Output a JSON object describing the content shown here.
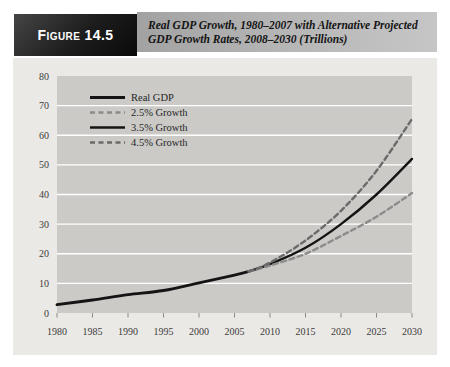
{
  "header": {
    "figure_label": "Figure 14.5",
    "title_line1": "Real GDP Growth, 1980–2007 with Alternative Projected",
    "title_line2": "GDP Growth Rates, 2008–2030 (Trillions)"
  },
  "colors": {
    "page_bg": "#ffffff",
    "badge_bg": "#141414",
    "badge_text": "#ffffff",
    "titlebar_left": "#a2a2a2",
    "titlebar_right": "#c6c6c6",
    "panel_bg": "#eae9e5",
    "plot_bg": "#cbcac7",
    "gridline": "#ffffff",
    "axis_text": "#3c3c3c",
    "tick": "#8a8a8a",
    "real_gdp_line": "#141414",
    "growth_25_line": "#8c8c8c",
    "growth_35_line": "#141414",
    "growth_45_line": "#6b6b6b"
  },
  "chart_data": {
    "type": "line",
    "title": "Real GDP Growth, 1980–2007 with Alternative Projected GDP Growth Rates, 2008–2030 (Trillions)",
    "xlabel": "",
    "ylabel": "",
    "units": "Trillions of dollars",
    "xlim": [
      1980,
      2030
    ],
    "ylim": [
      0,
      80
    ],
    "x_ticks": [
      1980,
      1985,
      1990,
      1995,
      2000,
      2005,
      2010,
      2015,
      2020,
      2025,
      2030
    ],
    "y_ticks": [
      0,
      10,
      20,
      30,
      40,
      50,
      60,
      70,
      80
    ],
    "grid": "horizontal",
    "legend_position": "upper-left-inside",
    "series": [
      {
        "name": "Real GDP",
        "style": "solid",
        "color": "#141414",
        "width": 2.8,
        "points": [
          [
            1980,
            2.8
          ],
          [
            1985,
            4.4
          ],
          [
            1990,
            6.2
          ],
          [
            1995,
            7.6
          ],
          [
            2000,
            10.2
          ],
          [
            2005,
            12.8
          ],
          [
            2007,
            14
          ]
        ]
      },
      {
        "name": "2.5% Growth",
        "style": "dashed",
        "color": "#8c8c8c",
        "width": 2.4,
        "points": [
          [
            2007,
            14
          ],
          [
            2010,
            16
          ],
          [
            2015,
            20
          ],
          [
            2020,
            26
          ],
          [
            2025,
            32.5
          ],
          [
            2030,
            40.5
          ]
        ]
      },
      {
        "name": "3.5% Growth",
        "style": "solid",
        "color": "#141414",
        "width": 2.4,
        "points": [
          [
            2007,
            14
          ],
          [
            2010,
            16.5
          ],
          [
            2015,
            22
          ],
          [
            2020,
            30
          ],
          [
            2025,
            40
          ],
          [
            2030,
            52
          ]
        ]
      },
      {
        "name": "4.5% Growth",
        "style": "dashed",
        "color": "#6b6b6b",
        "width": 2.4,
        "points": [
          [
            2007,
            14
          ],
          [
            2010,
            17
          ],
          [
            2015,
            24.5
          ],
          [
            2020,
            34.5
          ],
          [
            2025,
            48
          ],
          [
            2030,
            65.5
          ]
        ]
      }
    ]
  }
}
